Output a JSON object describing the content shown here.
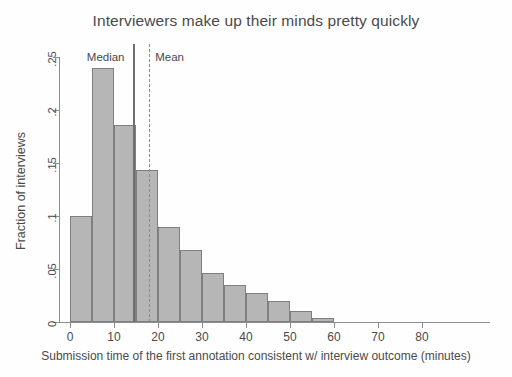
{
  "chart_data": {
    "type": "bar",
    "title": "Interviewers make up their minds pretty quickly",
    "xlabel": "Submission time of the first annotation consistent w/ interview outcome (minutes)",
    "ylabel": "Fraction of interviews",
    "xlim": [
      -3,
      95
    ],
    "ylim": [
      0,
      0.26
    ],
    "xticks": [
      "0",
      "10",
      "20",
      "30",
      "40",
      "50",
      "60",
      "70",
      "80"
    ],
    "xtick_values": [
      0,
      10,
      20,
      30,
      40,
      50,
      60,
      70,
      80
    ],
    "yticks": [
      "0",
      ".05",
      ".1",
      ".15",
      ".2",
      ".25"
    ],
    "ytick_values": [
      0,
      0.05,
      0.1,
      0.15,
      0.2,
      0.25
    ],
    "grid": false,
    "legend": "none",
    "bin_width": 5,
    "bin_starts": [
      0,
      5,
      10,
      15,
      20,
      25,
      30,
      35,
      40,
      45,
      50,
      55
    ],
    "categories": [
      "0-5",
      "5-10",
      "10-15",
      "15-20",
      "20-25",
      "25-30",
      "30-35",
      "35-40",
      "40-45",
      "45-50",
      "50-55",
      "55-60"
    ],
    "values": [
      0.1,
      0.24,
      0.186,
      0.143,
      0.09,
      0.068,
      0.046,
      0.035,
      0.027,
      0.02,
      0.01,
      0.004
    ],
    "annotations": [
      {
        "name": "median",
        "label": "Median",
        "value": 14.5,
        "style": "solid"
      },
      {
        "name": "mean",
        "label": "Mean",
        "value": 18.0,
        "style": "dashed"
      }
    ],
    "colors": {
      "bar_fill": "#b6b6b6",
      "bar_stroke": "#7f7f7f",
      "axis": "#8d8d8d",
      "text": "#4a4a4a",
      "median_line": "#6e6e6e",
      "mean_line": "#8a8a8a"
    }
  }
}
